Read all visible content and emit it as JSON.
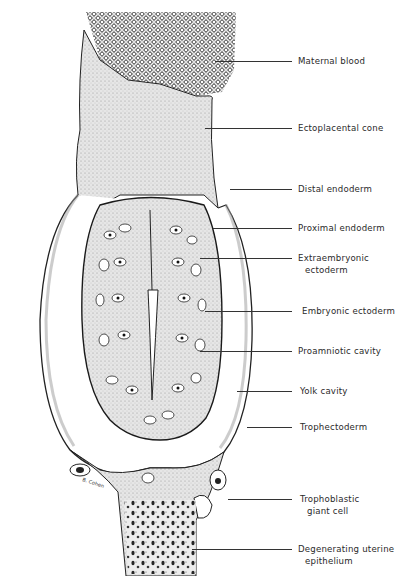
{
  "figure": {
    "signature": "B. Cohen",
    "labels": [
      {
        "id": "maternal-blood",
        "line1": "Maternal blood",
        "line2": "",
        "y": 61,
        "x_start": 215
      },
      {
        "id": "ectoplacental-cone",
        "line1": "Ectoplacental cone",
        "line2": "",
        "y": 128,
        "x_start": 205
      },
      {
        "id": "distal-endoderm",
        "line1": "Distal endoderm",
        "line2": "",
        "y": 189,
        "x_start": 230
      },
      {
        "id": "proximal-endoderm",
        "line1": "Proximal endoderm",
        "line2": "",
        "y": 228,
        "x_start": 213
      },
      {
        "id": "extraembryonic-ectoderm",
        "line1": "Extraembryonic",
        "line2": "ectoderm",
        "y": 258,
        "x_start": 200
      },
      {
        "id": "embryonic-ectoderm",
        "line1": "Embryonic ectoderm",
        "line2": "",
        "y": 311,
        "x_start": 205
      },
      {
        "id": "proamniotic-cavity",
        "line1": "Proamniotic cavity",
        "line2": "",
        "y": 351,
        "x_start": 200
      },
      {
        "id": "yolk-cavity",
        "line1": "Yolk cavity",
        "line2": "",
        "y": 391,
        "x_start": 237
      },
      {
        "id": "trophectoderm",
        "line1": "Trophectoderm",
        "line2": "",
        "y": 427,
        "x_start": 247
      },
      {
        "id": "trophoblastic-giant-cell",
        "line1": "Trophoblastic",
        "line2": "giant cell",
        "y": 499,
        "x_start": 228
      },
      {
        "id": "degenerating-uterine-epithelium",
        "line1": "Degenerating uterine",
        "line2": "epithelium",
        "y": 549,
        "x_start": 192
      }
    ],
    "colors": {
      "ink": "#1a1a1a",
      "tissue": "#d9d9d9",
      "background": "#ffffff"
    }
  }
}
